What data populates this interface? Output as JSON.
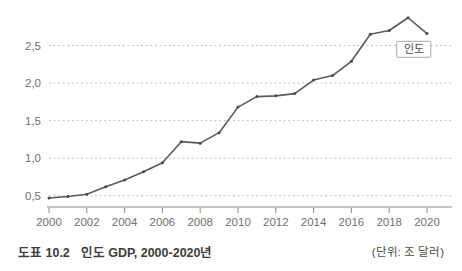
{
  "caption": {
    "figure_number": "도표 10.2",
    "figure_title": "인도 GDP, 2000-2020년",
    "unit_note": "(단위: 조 달러)"
  },
  "legend": {
    "series_label": "인도"
  },
  "axis": {
    "y_ticks": [
      "0,5",
      "1,0",
      "1,5",
      "2,0",
      "2,5"
    ],
    "x_ticks": [
      "2000",
      "2002",
      "2004",
      "2006",
      "2008",
      "2010",
      "2012",
      "2014",
      "2016",
      "2018",
      "2020"
    ]
  },
  "colors": {
    "line": "#5a5a5a",
    "marker": "#4a4a4a",
    "grid": "#bfbfbf",
    "axis": "#8a8a8a",
    "tick_text": "#707070",
    "caption_text": "#3d3d3d",
    "background": "#ffffff"
  },
  "chart_data": {
    "type": "line",
    "title": "인도 GDP, 2000-2020년",
    "subtitle": "",
    "xlabel": "",
    "ylabel": "",
    "unit": "조 달러",
    "grid": true,
    "grid_axis": "y",
    "legend_position": "inside-right",
    "xlim": [
      2000,
      2020
    ],
    "ylim": [
      0.35,
      3.0
    ],
    "ytick_values": [
      0.5,
      1.0,
      1.5,
      2.0,
      2.5
    ],
    "xtick_values": [
      2000,
      2002,
      2004,
      2006,
      2008,
      2010,
      2012,
      2014,
      2016,
      2018,
      2020
    ],
    "series": [
      {
        "name": "인도",
        "x": [
          2000,
          2001,
          2002,
          2003,
          2004,
          2005,
          2006,
          2007,
          2008,
          2009,
          2010,
          2011,
          2012,
          2013,
          2014,
          2015,
          2016,
          2017,
          2018,
          2019,
          2020
        ],
        "values": [
          0.47,
          0.49,
          0.52,
          0.62,
          0.71,
          0.82,
          0.94,
          1.22,
          1.2,
          1.34,
          1.68,
          1.82,
          1.83,
          1.86,
          2.04,
          2.1,
          2.29,
          2.65,
          2.7,
          2.87,
          2.66
        ]
      }
    ],
    "annotations": [
      {
        "text": "인도",
        "type": "series-label-box",
        "x": 2019.3,
        "y": 2.45
      }
    ]
  }
}
